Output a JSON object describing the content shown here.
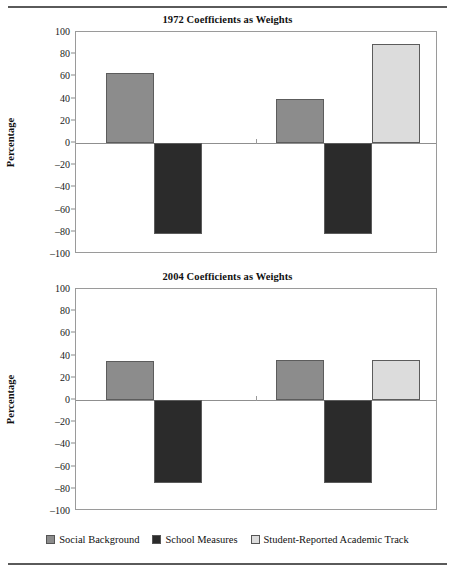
{
  "figure": {
    "rule_top": "horizontal-rule",
    "rule_bottom": "horizontal-rule"
  },
  "legend": {
    "items": [
      {
        "label": "Social Background",
        "color": "#8c8c8c",
        "key": "social_background"
      },
      {
        "label": "School Measures",
        "color": "#2b2b2b",
        "key": "school_measures"
      },
      {
        "label": "Student-Reported Academic Track",
        "color": "#dcdcdc",
        "key": "academic_track"
      }
    ]
  },
  "chart_data": [
    {
      "type": "bar",
      "title": "1972 Coefficients as Weights",
      "xlabel": "",
      "ylabel": "Percentage",
      "ylim": [
        -100,
        100
      ],
      "yticks": [
        100,
        80,
        60,
        40,
        20,
        0,
        -20,
        -40,
        -60,
        -80,
        -100
      ],
      "ytick_labels": [
        "100",
        "80",
        "60",
        "40",
        "20",
        "0",
        "–20",
        "–40",
        "–60",
        "–80",
        "–100"
      ],
      "grid": false,
      "legend_position": "bottom",
      "categories": [
        "Group 1",
        "Group 2"
      ],
      "series": [
        {
          "name": "Social Background",
          "color": "#8c8c8c",
          "values": [
            63,
            40
          ]
        },
        {
          "name": "School Measures",
          "color": "#2b2b2b",
          "values": [
            -82,
            -82
          ]
        },
        {
          "name": "Student-Reported Academic Track",
          "color": "#dcdcdc",
          "values": [
            null,
            89
          ]
        }
      ]
    },
    {
      "type": "bar",
      "title": "2004 Coefficients as Weights",
      "xlabel": "",
      "ylabel": "Percentage",
      "ylim": [
        -100,
        100
      ],
      "yticks": [
        100,
        80,
        60,
        40,
        20,
        0,
        -20,
        -40,
        -60,
        -80,
        -100
      ],
      "ytick_labels": [
        "100",
        "80",
        "60",
        "40",
        "20",
        "0",
        "–20",
        "–40",
        "–60",
        "–80",
        "–100"
      ],
      "grid": false,
      "legend_position": "bottom",
      "categories": [
        "Group 1",
        "Group 2"
      ],
      "series": [
        {
          "name": "Social Background",
          "color": "#8c8c8c",
          "values": [
            35,
            36
          ]
        },
        {
          "name": "School Measures",
          "color": "#2b2b2b",
          "values": [
            -75,
            -75
          ]
        },
        {
          "name": "Student-Reported Academic Track",
          "color": "#dcdcdc",
          "values": [
            null,
            36
          ]
        }
      ]
    }
  ]
}
